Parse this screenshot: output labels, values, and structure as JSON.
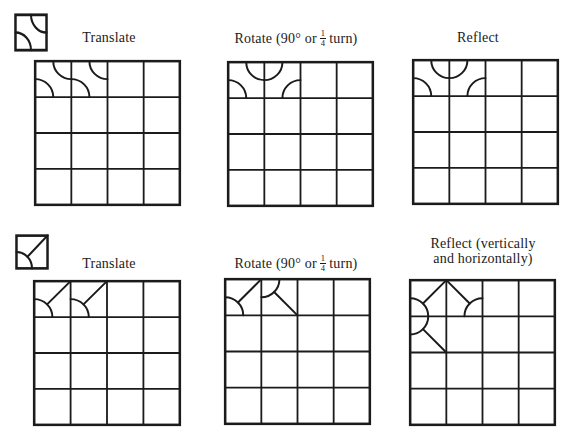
{
  "colors": {
    "ink": "#1b1b1b",
    "paper": "#ffffff"
  },
  "radius": 0.5,
  "motifs": {
    "A": {
      "arcs": [
        {
          "cx": 1,
          "cy": 0,
          "a0": 180,
          "a1": 90
        },
        {
          "cx": 0,
          "cy": 1,
          "a0": -90,
          "a1": 0
        }
      ],
      "lines": []
    },
    "A2": {
      "arcs": [
        {
          "cx": 0,
          "cy": 0,
          "a0": 0,
          "a1": 90
        },
        {
          "cx": 1,
          "cy": 1,
          "a0": 180,
          "a1": 270
        }
      ],
      "lines": []
    },
    "B": {
      "arcs": [
        {
          "cx": 0,
          "cy": 1,
          "a0": -90,
          "a1": 0
        }
      ],
      "lines": [
        {
          "x1": 1,
          "y1": 0,
          "x2": 0.3536,
          "y2": 0.6464
        }
      ]
    },
    "B2": {
      "arcs": [
        {
          "cx": 0,
          "cy": 0,
          "a0": 0,
          "a1": 90
        }
      ],
      "lines": [
        {
          "x1": 1,
          "y1": 1,
          "x2": 0.3536,
          "y2": 0.3536
        }
      ]
    },
    "B3": {
      "arcs": [
        {
          "cx": 1,
          "cy": 1,
          "a0": 180,
          "a1": 270
        }
      ],
      "lines": [
        {
          "x1": 0,
          "y1": 0,
          "x2": 0.6464,
          "y2": 0.6464
        }
      ]
    }
  },
  "tiles": [
    {
      "name": "source-tile-top",
      "motif": "A"
    },
    {
      "name": "source-tile-bottom",
      "motif": "B"
    }
  ],
  "rows": [
    {
      "panels": [
        {
          "label": {
            "text": "Translate"
          },
          "grid": {
            "rows": 4,
            "cols": 4,
            "cells": [
              {
                "r": 0,
                "c": 0,
                "m": "A"
              },
              {
                "r": 0,
                "c": 1,
                "m": "A"
              }
            ]
          }
        },
        {
          "label": {
            "prefix": "Rotate (90° or",
            "frac_num": "1",
            "frac_den": "4",
            "suffix": "turn)"
          },
          "grid": {
            "rows": 4,
            "cols": 4,
            "cells": [
              {
                "r": 0,
                "c": 0,
                "m": "A"
              },
              {
                "r": 0,
                "c": 1,
                "m": "A2"
              }
            ]
          }
        },
        {
          "label": {
            "text": "Reflect"
          },
          "grid": {
            "rows": 4,
            "cols": 4,
            "cells": [
              {
                "r": 0,
                "c": 0,
                "m": "A"
              },
              {
                "r": 0,
                "c": 1,
                "m": "A2"
              }
            ]
          }
        }
      ]
    },
    {
      "panels": [
        {
          "label": {
            "text": "Translate"
          },
          "grid": {
            "rows": 4,
            "cols": 4,
            "cells": [
              {
                "r": 0,
                "c": 0,
                "m": "B"
              },
              {
                "r": 0,
                "c": 1,
                "m": "B"
              }
            ]
          }
        },
        {
          "label": {
            "prefix": "Rotate (90° or",
            "frac_num": "1",
            "frac_den": "4",
            "suffix": "turn)"
          },
          "grid": {
            "rows": 4,
            "cols": 4,
            "cells": [
              {
                "r": 0,
                "c": 0,
                "m": "B"
              },
              {
                "r": 0,
                "c": 1,
                "m": "B2"
              }
            ]
          }
        },
        {
          "label": {
            "line1": "Reflect (vertically",
            "line2": "and horizontally)"
          },
          "grid": {
            "rows": 4,
            "cols": 4,
            "cells": [
              {
                "r": 0,
                "c": 0,
                "m": "B"
              },
              {
                "r": 0,
                "c": 1,
                "m": "B3"
              },
              {
                "r": 1,
                "c": 0,
                "m": "B2"
              }
            ]
          }
        }
      ]
    }
  ]
}
